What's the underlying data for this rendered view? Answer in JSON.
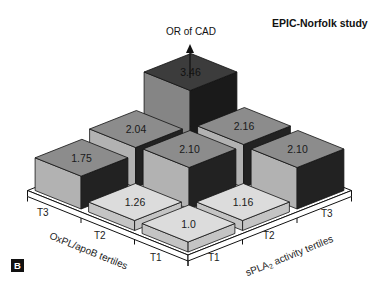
{
  "title": "EPIC-Norfolk study",
  "panel_label": "B",
  "z_axis_label": "OR of CAD",
  "x_axis": {
    "label_prefix": "sPLA",
    "label_sub": "2",
    "label_suffix": " activity tertiles",
    "ticks": [
      "T1",
      "T2",
      "T3"
    ]
  },
  "y_axis": {
    "label": "OxPL/apoB tertiles",
    "ticks": [
      "T1",
      "T2",
      "T3"
    ]
  },
  "colors": {
    "light_top": "#dcdcdc",
    "light_side": "#c4c4c4",
    "mid_top": "#8c8c8c",
    "mid_left": "#b2b2b2",
    "mid_right": "#222222",
    "dark_top": "#3c3c3c",
    "dark_left": "#858585",
    "dark_right": "#1a1a1a"
  },
  "chart_data": {
    "type": "bar3d",
    "title": "EPIC-Norfolk study",
    "zlabel": "OR of CAD",
    "xlabel": "sPLA2 activity tertiles",
    "ylabel": "OxPL/apoB tertiles",
    "x_categories": [
      "T1",
      "T2",
      "T3"
    ],
    "y_categories": [
      "T1",
      "T2",
      "T3"
    ],
    "values": [
      {
        "oxpl_apob": "T1",
        "spla2": "T1",
        "or": 1.0,
        "label": "1.0",
        "tone": "light"
      },
      {
        "oxpl_apob": "T1",
        "spla2": "T2",
        "or": 1.16,
        "label": "1.16",
        "tone": "light"
      },
      {
        "oxpl_apob": "T1",
        "spla2": "T3",
        "or": 2.1,
        "label": "2.10",
        "tone": "mid"
      },
      {
        "oxpl_apob": "T2",
        "spla2": "T1",
        "or": 1.26,
        "label": "1.26",
        "tone": "light"
      },
      {
        "oxpl_apob": "T2",
        "spla2": "T2",
        "or": 2.1,
        "label": "2.10",
        "tone": "mid"
      },
      {
        "oxpl_apob": "T2",
        "spla2": "T3",
        "or": 2.16,
        "label": "2.16",
        "tone": "mid"
      },
      {
        "oxpl_apob": "T3",
        "spla2": "T1",
        "or": 1.75,
        "label": "1.75",
        "tone": "mid"
      },
      {
        "oxpl_apob": "T3",
        "spla2": "T2",
        "or": 2.04,
        "label": "2.04",
        "tone": "mid"
      },
      {
        "oxpl_apob": "T3",
        "spla2": "T3",
        "or": 3.46,
        "label": "3.46",
        "tone": "dark"
      }
    ]
  }
}
